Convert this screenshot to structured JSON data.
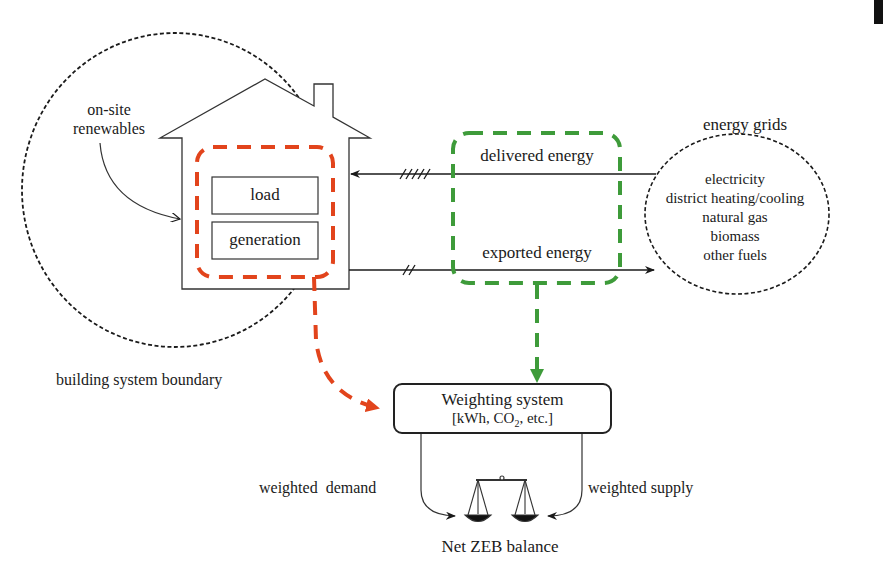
{
  "diagram": {
    "type": "Net ZEB balance concept diagram",
    "building": {
      "boundary_label": "building system boundary",
      "renewables_label_line1": "on-site",
      "renewables_label_line2": "renewables",
      "load_label": "load",
      "generation_label": "generation"
    },
    "flows": {
      "delivered_label": "delivered energy",
      "exported_label": "exported energy"
    },
    "grids": {
      "title": "energy grids",
      "items": [
        "electricity",
        "district heating/cooling",
        "natural gas",
        "biomass",
        "other fuels"
      ]
    },
    "weighting": {
      "title": "Weighting system",
      "units_prefix": "[kWh, CO",
      "units_sub": "2",
      "units_suffix": ", etc.]"
    },
    "balance": {
      "demand_label": "weighted  demand",
      "supply_label": "weighted supply",
      "result_label": "Net ZEB balance"
    },
    "colors": {
      "line": "#1a1a1a",
      "red_dashed": "#e2441c",
      "green_dashed": "#3e9b3a"
    }
  }
}
